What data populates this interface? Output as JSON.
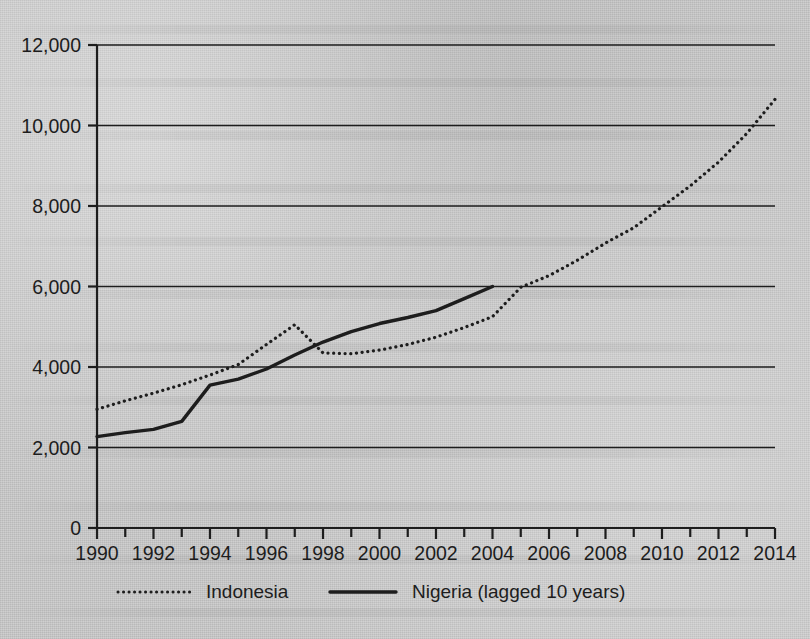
{
  "chart_data": {
    "type": "line",
    "title": "",
    "xlabel": "",
    "ylabel": "",
    "xlim": [
      1990,
      2014
    ],
    "ylim": [
      0,
      12000
    ],
    "grid": "horizontal",
    "legend_position": "bottom",
    "y_ticks": [
      0,
      2000,
      4000,
      6000,
      8000,
      10000,
      12000
    ],
    "y_tick_labels": [
      "0",
      "2,000",
      "4,000",
      "6,000",
      "8,000",
      "10,000",
      "12,000"
    ],
    "x_ticks": [
      1990,
      1991,
      1992,
      1993,
      1994,
      1995,
      1996,
      1997,
      1998,
      1999,
      2000,
      2001,
      2002,
      2003,
      2004,
      2005,
      2006,
      2007,
      2008,
      2009,
      2010,
      2011,
      2012,
      2013,
      2014
    ],
    "x_tick_labels": [
      "1990",
      "",
      "1992",
      "",
      "1994",
      "",
      "1996",
      "",
      "1998",
      "",
      "2000",
      "",
      "2002",
      "",
      "2004",
      "",
      "2006",
      "",
      "2008",
      "",
      "2010",
      "",
      "2012",
      "",
      "2014"
    ],
    "x_labeled_ticks": [
      1990,
      1992,
      1994,
      1996,
      1998,
      2000,
      2002,
      2004,
      2006,
      2008,
      2010,
      2012,
      2014
    ],
    "series": [
      {
        "name": "Indonesia",
        "style": "dotted",
        "color": "#1d1d1d",
        "x": [
          1990,
          1991,
          1992,
          1993,
          1994,
          1995,
          1996,
          1997,
          1998,
          1999,
          2000,
          2001,
          2002,
          2003,
          2004,
          2005,
          2006,
          2007,
          2008,
          2009,
          2010,
          2011,
          2012,
          2013,
          2014
        ],
        "values": [
          2950,
          3160,
          3350,
          3560,
          3800,
          4060,
          4560,
          5050,
          4350,
          4330,
          4420,
          4560,
          4740,
          4980,
          5250,
          5980,
          6270,
          6650,
          7080,
          7460,
          7980,
          8500,
          9090,
          9800,
          10650
        ]
      },
      {
        "name": "Nigeria (lagged 10 years)",
        "style": "solid",
        "color": "#1d1d1d",
        "x": [
          1990,
          1991,
          1992,
          1993,
          1994,
          1995,
          1996,
          1997,
          1998,
          1999,
          2000,
          2001,
          2002,
          2003,
          2004
        ],
        "values": [
          2270,
          2370,
          2450,
          2650,
          3550,
          3700,
          3950,
          4300,
          4620,
          4880,
          5080,
          5230,
          5400,
          5700,
          6000
        ]
      }
    ],
    "legend_entries": [
      {
        "label": "Indonesia",
        "style": "dotted"
      },
      {
        "label": "Nigeria (lagged 10 years)",
        "style": "solid"
      }
    ],
    "axis_color": "#1d1d1d",
    "background_color": "#c9c9c9"
  }
}
